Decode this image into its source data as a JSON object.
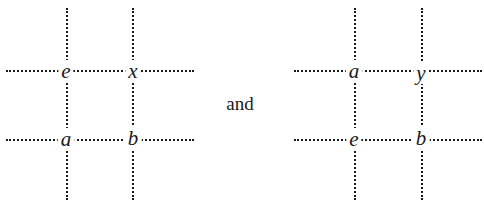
{
  "diagrams": [
    {
      "name": "left-grid",
      "top_left": "e",
      "top_right": "x",
      "bottom_left": "a",
      "bottom_right": "b"
    },
    {
      "name": "right-grid",
      "top_left": "a",
      "top_right": "y",
      "bottom_left": "e",
      "bottom_right": "b"
    }
  ],
  "conjunction": "and",
  "line_color": "#1a1a1a"
}
